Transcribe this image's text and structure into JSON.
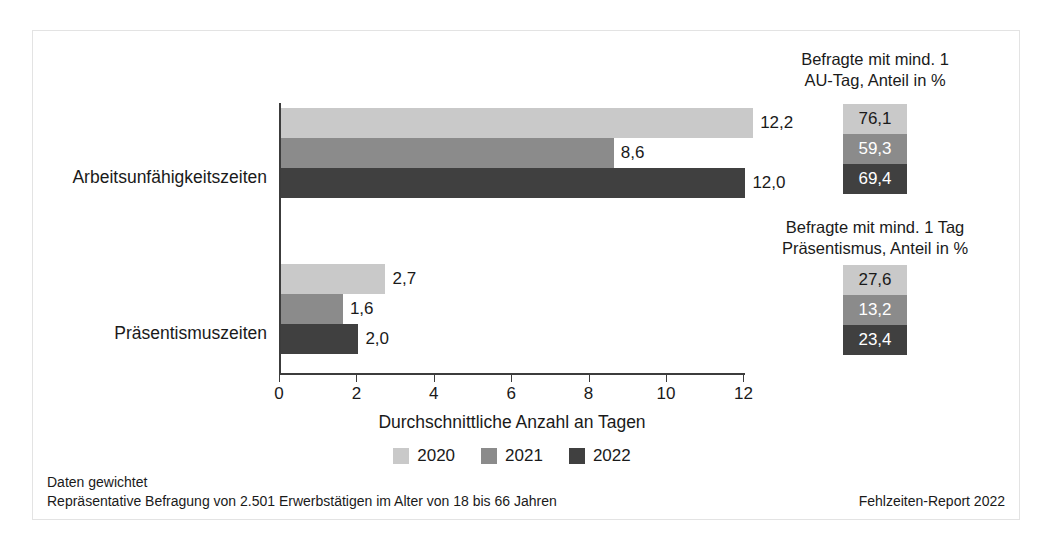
{
  "chart_data": {
    "type": "bar",
    "orientation": "horizontal",
    "title": "",
    "xlabel": "Durchschnittliche Anzahl an Tagen",
    "ylabel": "",
    "xlim": [
      0,
      12.6
    ],
    "xticks": [
      0,
      2,
      4,
      6,
      8,
      10,
      12
    ],
    "xtick_labels": [
      "0",
      "2",
      "4",
      "6",
      "8",
      "10",
      "12"
    ],
    "grid": false,
    "legend_position": "bottom-center",
    "categories": [
      "Arbeitsunfähigkeitszeiten",
      "Präsentismuszeiten"
    ],
    "series": [
      {
        "name": "2020",
        "color": "#c9c9c9",
        "values": [
          12.2,
          2.7
        ],
        "labels": [
          "12,2",
          "2,7"
        ],
        "label_color": "#1a1a1a"
      },
      {
        "name": "2021",
        "color": "#8b8b8b",
        "values": [
          8.6,
          1.6
        ],
        "labels": [
          "8,6",
          "1,6"
        ],
        "label_color": "#1a1a1a"
      },
      {
        "name": "2022",
        "color": "#404040",
        "values": [
          12.0,
          2.0
        ],
        "labels": [
          "12,0",
          "2,0"
        ],
        "label_color": "#1a1a1a"
      }
    ],
    "side_panels": [
      {
        "title": "Befragte mit mind. 1\nAU-Tag, Anteil in %",
        "title_line1": "Befragte mit mind. 1",
        "title_line2": "AU-Tag, Anteil in %",
        "cells": [
          {
            "label": "76,1",
            "value": 76.1,
            "bg": "#c9c9c9",
            "fg": "#1a1a1a"
          },
          {
            "label": "59,3",
            "value": 59.3,
            "bg": "#8b8b8b",
            "fg": "#ffffff"
          },
          {
            "label": "69,4",
            "value": 69.4,
            "bg": "#404040",
            "fg": "#ffffff"
          }
        ]
      },
      {
        "title": "Befragte mit mind. 1 Tag\nPräsentismus, Anteil in %",
        "title_line1": "Befragte mit mind. 1 Tag",
        "title_line2": "Präsentismus, Anteil in %",
        "cells": [
          {
            "label": "27,6",
            "value": 27.6,
            "bg": "#c9c9c9",
            "fg": "#1a1a1a"
          },
          {
            "label": "13,2",
            "value": 13.2,
            "bg": "#8b8b8b",
            "fg": "#ffffff"
          },
          {
            "label": "23,4",
            "value": 23.4,
            "bg": "#404040",
            "fg": "#ffffff"
          }
        ]
      }
    ]
  },
  "axis": {
    "x_title": "Durchschnittliche Anzahl an Tagen",
    "tick_labels": [
      "0",
      "2",
      "4",
      "6",
      "8",
      "10",
      "12"
    ]
  },
  "categories": {
    "first": "Arbeitsunfähigkeitszeiten",
    "second": "Präsentismuszeiten"
  },
  "legend": {
    "items": [
      {
        "label": "2020",
        "color": "#c9c9c9"
      },
      {
        "label": "2021",
        "color": "#8b8b8b"
      },
      {
        "label": "2022",
        "color": "#404040"
      }
    ]
  },
  "side_panel_1": {
    "title_line1": "Befragte mit mind. 1",
    "title_line2": "AU-Tag, Anteil in %",
    "v2020": "76,1",
    "v2021": "59,3",
    "v2022": "69,4"
  },
  "side_panel_2": {
    "title_line1": "Befragte mit mind. 1 Tag",
    "title_line2": "Präsentismus, Anteil in %",
    "v2020": "27,6",
    "v2021": "13,2",
    "v2022": "23,4"
  },
  "bar_labels": {
    "g1_2020": "12,2",
    "g1_2021": "8,6",
    "g1_2022": "12,0",
    "g2_2020": "2,7",
    "g2_2021": "1,6",
    "g2_2022": "2,0"
  },
  "footer": {
    "line1": "Daten gewichtet",
    "line2": "Repräsentative Befragung von 2.501 Erwerbstätigen im Alter von 18 bis 66 Jahren",
    "source": "Fehlzeiten-Report 2022"
  },
  "colors": {
    "series_2020": "#c9c9c9",
    "series_2021": "#8b8b8b",
    "series_2022": "#404040",
    "axis": "#3c3c3c",
    "text": "#1a1a1a",
    "border": "#e3e3e3"
  }
}
